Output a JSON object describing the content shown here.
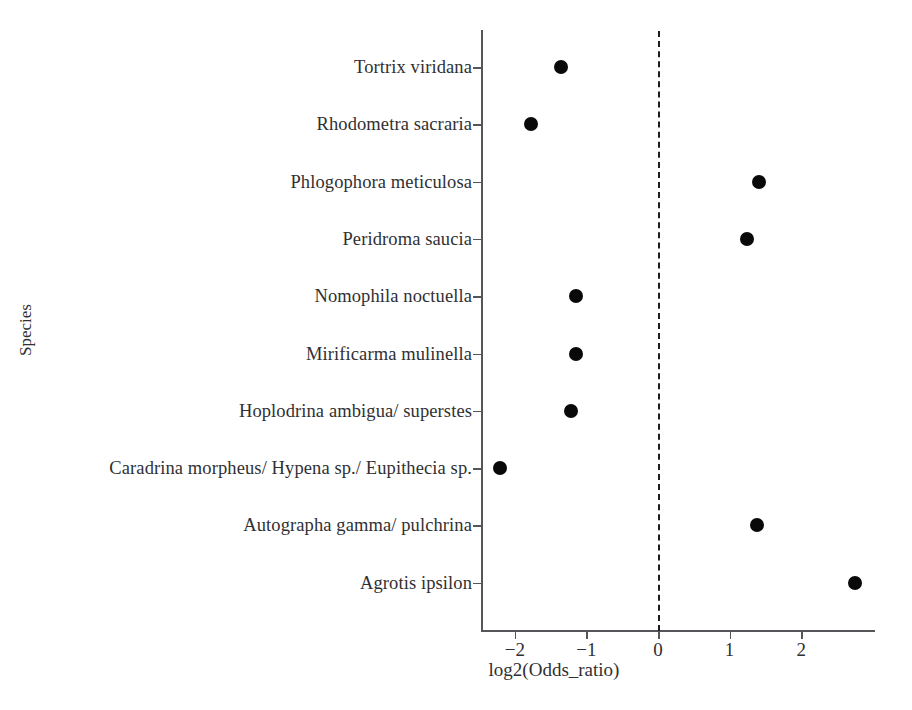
{
  "chart_data": {
    "type": "scatter",
    "title": "",
    "xlabel": "log2(Odds_ratio)",
    "ylabel": "Species",
    "xlim": [
      -2.6,
      3.05
    ],
    "xticks": [
      -2,
      -1,
      0,
      1,
      2
    ],
    "xticklabels": [
      "−2",
      "−1",
      "0",
      "1",
      "2"
    ],
    "grid": false,
    "legend": null,
    "reference_line": {
      "x": 0,
      "style": "dashed",
      "color": "#1d1d1d"
    },
    "marker": {
      "shape": "circle",
      "color": "#090909",
      "size": 14
    },
    "categories": [
      "Tortrix viridana",
      "Rhodometra sacraria",
      "Phlogophora meticulosa",
      "Peridroma saucia",
      "Nomophila noctuella",
      "Mirificarma mulinella",
      "Hoplodrina ambigua/ superstes",
      "Caradrina morpheus/ Hypena sp./ Eupithecia sp.",
      "Autographa gamma/ pulchrina",
      "Agrotis ipsilon"
    ],
    "values": [
      -1.36,
      -1.78,
      1.41,
      1.24,
      -1.15,
      -1.15,
      -1.22,
      -2.21,
      1.38,
      2.75
    ],
    "points": [
      {
        "species": "Tortrix viridana",
        "log2_odds_ratio": -1.36
      },
      {
        "species": "Rhodometra sacraria",
        "log2_odds_ratio": -1.78
      },
      {
        "species": "Phlogophora meticulosa",
        "log2_odds_ratio": 1.41
      },
      {
        "species": "Peridroma saucia",
        "log2_odds_ratio": 1.24
      },
      {
        "species": "Nomophila noctuella",
        "log2_odds_ratio": -1.15
      },
      {
        "species": "Mirificarma mulinella",
        "log2_odds_ratio": -1.15
      },
      {
        "species": "Hoplodrina ambigua/ superstes",
        "log2_odds_ratio": -1.22
      },
      {
        "species": "Caradrina morpheus/ Hypena sp./ Eupithecia sp.",
        "log2_odds_ratio": -2.21
      },
      {
        "species": "Autographa gamma/ pulchrina",
        "log2_odds_ratio": 1.38
      },
      {
        "species": "Agrotis ipsilon",
        "log2_odds_ratio": 2.75
      }
    ]
  },
  "colors": {
    "background": "#ffffff",
    "axis": "#55565a",
    "text": "#2f3033",
    "marker": "#090909",
    "reference_line": "#1d1d1d"
  }
}
